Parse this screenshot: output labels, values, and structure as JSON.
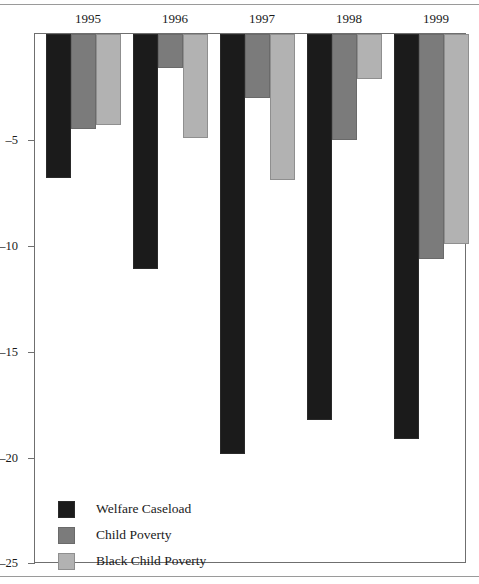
{
  "chart_data": {
    "type": "bar",
    "title": "",
    "subtitle": "",
    "xlabel": "",
    "ylabel": "",
    "categories": [
      "1995",
      "1996",
      "1997",
      "1998",
      "1999"
    ],
    "series": [
      {
        "name": "Welfare Caseload",
        "color": "#1b1b1b",
        "values": [
          -6.8,
          -11.1,
          -19.8,
          -18.2,
          -19.1
        ]
      },
      {
        "name": "Child Poverty",
        "color": "#7b7b7b",
        "values": [
          -4.5,
          -1.6,
          -3.0,
          -5.0,
          -10.6
        ]
      },
      {
        "name": "Black Child Poverty",
        "color": "#b2b2b2",
        "values": [
          -4.3,
          -4.9,
          -6.9,
          -2.1,
          -9.9
        ]
      }
    ],
    "ylim": [
      -25,
      0
    ],
    "yticks": [
      -5,
      -10,
      -15,
      -20,
      -25
    ],
    "ytick_labels": [
      "–5",
      "–10",
      "–15",
      "–20",
      "–25"
    ],
    "grid": false,
    "legend_position": "inside-bottom-left",
    "orientation": "vertical",
    "bars_direction": "downward-from-zero"
  },
  "legend": {
    "items": [
      {
        "label": "Welfare Caseload"
      },
      {
        "label": "Child Poverty"
      },
      {
        "label": "Black Child Poverty"
      }
    ]
  },
  "axis": {
    "x_group_labels": [
      "1995",
      "1996",
      "1997",
      "1998",
      "1999"
    ],
    "y_tick_labels": [
      "–5",
      "–10",
      "–15",
      "–20",
      "–25"
    ]
  }
}
